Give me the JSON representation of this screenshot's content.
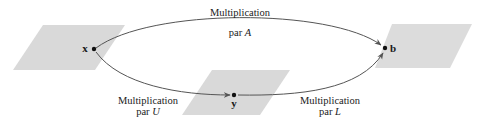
{
  "diagram": {
    "colors": {
      "plane_fill": "#d9d9d9",
      "arrow_stroke": "#555555",
      "text": "#1a1a1a",
      "background": "#ffffff"
    },
    "nodes": [
      {
        "id": "x",
        "label": "x"
      },
      {
        "id": "y",
        "label": "y"
      },
      {
        "id": "b",
        "label": "b"
      }
    ],
    "edges": [
      {
        "from": "x",
        "to": "b",
        "label_line1": "Multiplication",
        "label_line2_prefix": "par ",
        "label_line2_var": "A"
      },
      {
        "from": "x",
        "to": "y",
        "label_line1": "Multiplication",
        "label_line2_prefix": "par ",
        "label_line2_var": "U"
      },
      {
        "from": "y",
        "to": "b",
        "label_line1": "Multiplication",
        "label_line2_prefix": "par ",
        "label_line2_var": "L"
      }
    ]
  }
}
